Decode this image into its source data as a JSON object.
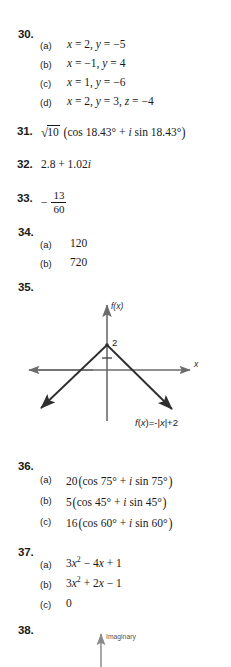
{
  "page": {
    "type": "textbook-answer-key",
    "background": "#ffffff",
    "text_color": "#1a1a1a"
  },
  "answers": [
    {
      "number": "30.",
      "parts": [
        {
          "label": "(a)",
          "text": "x = 2,  y = −5"
        },
        {
          "label": "(b)",
          "text": "x = −1,  y = 4"
        },
        {
          "label": "(c)",
          "text": "x = 1,  y = −6"
        },
        {
          "label": "(d)",
          "text": "x = 2,  y = 3,  z = −4"
        }
      ]
    },
    {
      "number": "31.",
      "text": "√10 (cos 18.43° + i sin 18.43°)",
      "radicand": "10",
      "inner": "cos 18.43° + i sin 18.43°"
    },
    {
      "number": "32.",
      "text": "2.8 + 1.02i"
    },
    {
      "number": "33.",
      "text": "− 13/60",
      "sign": "−",
      "numerator": "13",
      "denominator": "60"
    },
    {
      "number": "34.",
      "parts": [
        {
          "label": "(a)",
          "text": "120"
        },
        {
          "label": "(b)",
          "text": "720"
        }
      ]
    },
    {
      "number": "35.",
      "figure": "absolute-value-graph"
    },
    {
      "number": "36.",
      "parts": [
        {
          "label": "(a)",
          "text": "20 (cos 75° + i sin 75°)"
        },
        {
          "label": "(b)",
          "text": "5 (cos 45° + i sin 45°)"
        },
        {
          "label": "(c)",
          "text": "16 (cos 60° + i sin 60°)"
        }
      ]
    },
    {
      "number": "37.",
      "parts": [
        {
          "label": "(a)",
          "text": "3x² − 4x + 1"
        },
        {
          "label": "(b)",
          "text": "3x² + 2x − 1"
        },
        {
          "label": "(c)",
          "text": "0"
        }
      ]
    },
    {
      "number": "38.",
      "figure": "complex-plane-graph"
    }
  ],
  "figure_35": {
    "name": "absolute-value-graph",
    "y_axis_label": "f(x)",
    "x_axis_label": "x",
    "vertex_value": "2",
    "function_label": "f(x)=-|x|+2",
    "function_expression": "f(x) = −|x| + 2",
    "vertex": {
      "x": 0,
      "y": 2
    },
    "line_color": "#3a3a3a",
    "axis_color": "#6b6b6b"
  },
  "figure_38": {
    "name": "complex-plane-graph",
    "y_axis_label": "Imaginary",
    "axis_color": "#8a8a8a"
  }
}
